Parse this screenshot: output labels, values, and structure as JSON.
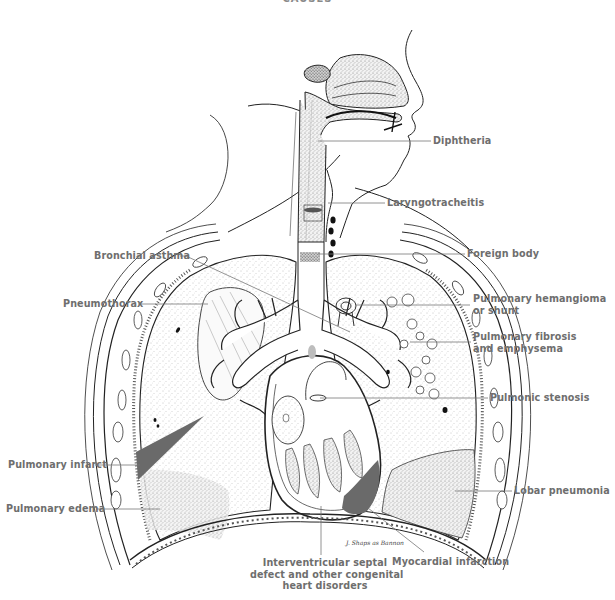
{
  "figure": {
    "heading": "CAUSES",
    "colors": {
      "label_text": "#6e6e6e",
      "leader_line": "#777777",
      "ink": "#222222",
      "lesion_fill": "#6a6a6a",
      "stipple": "#9a9a9a"
    },
    "signature": "J. Shaps as Bannon"
  },
  "labels": {
    "diphtheria": "Diphtheria",
    "laryngotracheitis": "Laryngotracheitis",
    "foreign_body": "Foreign body",
    "bronchial_asthma": "Bronchial asthma",
    "pneumothorax": "Pneumothorax",
    "pulmonary_hemangioma_line1": "Pulmonary hemangioma",
    "pulmonary_hemangioma_line2": "or shunt",
    "pulmonary_fibrosis_line1": "Pulmonary fibrosis",
    "pulmonary_fibrosis_line2": "and emphysema",
    "pulmonic_stenosis": "Pulmonic stenosis",
    "pulmonary_infarct": "Pulmonary infarct",
    "pulmonary_edema": "Pulmonary edema",
    "lobar_pneumonia": "Lobar pneumonia",
    "interventricular_line1": "Interventricular septal",
    "interventricular_line2": "defect and other congenital",
    "interventricular_line3": "heart disorders",
    "myocardial_infarction": "Myocardial infarction"
  }
}
